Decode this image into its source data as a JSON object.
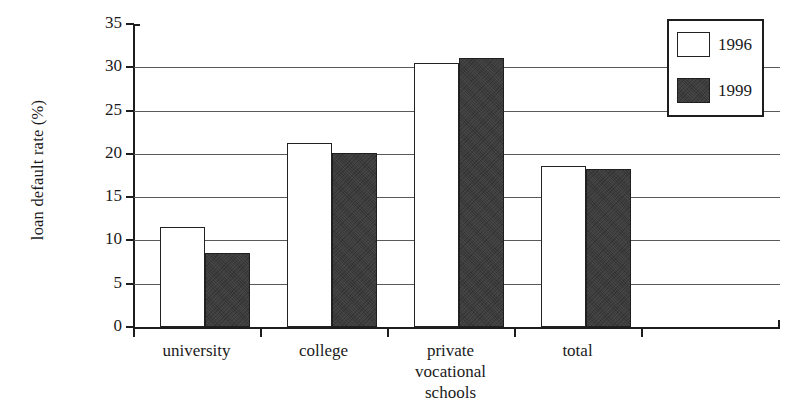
{
  "figure": {
    "cropped_title_fragment": "",
    "background_color": "#ffffff"
  },
  "chart_data": {
    "type": "bar",
    "title": "",
    "xlabel": "",
    "ylabel": "loan default rate (%)",
    "categories": [
      "university",
      "college",
      "private\nvocational\nschools",
      "total"
    ],
    "series": [
      {
        "name": "1996",
        "values": [
          11.5,
          21.3,
          30.5,
          18.6
        ],
        "color": "#ffffff",
        "edge_color": "#222222"
      },
      {
        "name": "1999",
        "values": [
          8.5,
          20.1,
          31.1,
          18.2
        ],
        "color": "#3b3b3b",
        "edge_color": "#1f1f1f"
      }
    ],
    "ylim": [
      0,
      35
    ],
    "ytick_labels": [
      "0",
      "5",
      "10",
      "15",
      "20",
      "25",
      "30",
      "35"
    ],
    "ytick_values": [
      0,
      5,
      10,
      15,
      20,
      25,
      30,
      35
    ],
    "grid": "horizontal",
    "grid_color": "#5a5a5a",
    "legend_position": "top-right",
    "legend_entries": [
      "1996",
      "1999"
    ],
    "axis_color": "#1d1d1d"
  }
}
